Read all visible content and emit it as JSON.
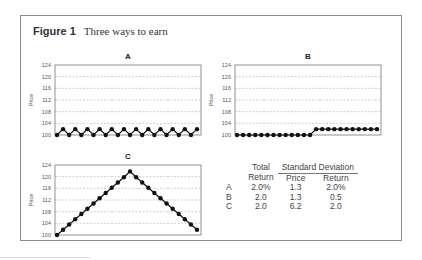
{
  "figure": {
    "label": "Figure 1",
    "title": "Three ways to earn"
  },
  "chart_data": [
    {
      "type": "line",
      "title": "A",
      "ylabel": "Price",
      "xlabel": "",
      "ylim": [
        100,
        124
      ],
      "yticks": [
        100,
        104,
        108,
        112,
        116,
        120,
        124
      ],
      "grid": true,
      "markers": true,
      "values": [
        100,
        102,
        100,
        102,
        100,
        102,
        100,
        102,
        100,
        102,
        100,
        102,
        100,
        102,
        100,
        102,
        100,
        102,
        100,
        102,
        100,
        102,
        100,
        102
      ]
    },
    {
      "type": "line",
      "title": "B",
      "ylabel": "Price",
      "xlabel": "",
      "ylim": [
        100,
        124
      ],
      "yticks": [
        100,
        104,
        108,
        112,
        116,
        120,
        124
      ],
      "grid": true,
      "markers": true,
      "values": [
        100,
        100,
        100,
        100,
        100,
        100,
        100,
        100,
        100,
        100,
        100,
        100,
        100,
        102,
        102,
        102,
        102,
        102,
        102,
        102,
        102,
        102,
        102,
        102
      ]
    },
    {
      "type": "line",
      "title": "C",
      "ylabel": "Price",
      "xlabel": "",
      "ylim": [
        100,
        124
      ],
      "yticks": [
        100,
        104,
        108,
        112,
        116,
        120,
        124
      ],
      "grid": true,
      "markers": true,
      "values": [
        100,
        101.8,
        103.6,
        105.4,
        107.2,
        109,
        110.8,
        112.6,
        114.4,
        116.2,
        118,
        119.8,
        121.8,
        119.8,
        118,
        116.2,
        114.4,
        112.6,
        110.8,
        109,
        107.2,
        105.4,
        103.6,
        101.8
      ]
    },
    {
      "type": "table",
      "header_groups": [
        {
          "label": "",
          "span": 1
        },
        {
          "label": "Total",
          "span": 1
        },
        {
          "label": "Standard Deviation",
          "span": 2
        }
      ],
      "columns": [
        "",
        "Return",
        "Price",
        "Return"
      ],
      "rows": [
        [
          "A",
          "2.0%",
          "1.3",
          "2.0%"
        ],
        [
          "B",
          "2.0",
          "1.3",
          "0.5"
        ],
        [
          "C",
          "2.0",
          "6.2",
          "2.0"
        ]
      ]
    }
  ]
}
